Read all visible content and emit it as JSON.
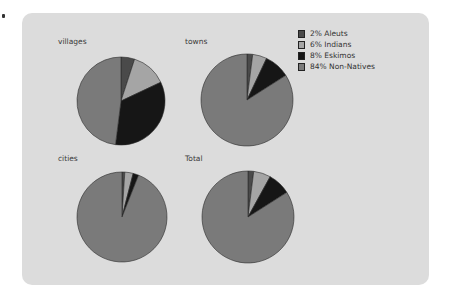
{
  "colors": {
    "panel_bg": "#dcdcdc",
    "Aleuts": "#4a4a4a",
    "Indians": "#a5a5a5",
    "Eskimos": "#161616",
    "Non-Natives": "#7a7a7a",
    "outline": "#2a2a2a"
  },
  "legend": {
    "items": [
      {
        "label": "2% Aleuts",
        "key": "Aleuts"
      },
      {
        "label": "6% Indians",
        "key": "Indians"
      },
      {
        "label": "8% Eskimos",
        "key": "Eskimos"
      },
      {
        "label": "84% Non-Natives",
        "key": "Non-Natives"
      }
    ]
  },
  "pies": [
    {
      "title": "villages",
      "cx": 121,
      "cy": 101,
      "r": 44,
      "label_x": 58,
      "label_y": 37
    },
    {
      "title": "towns",
      "cx": 247,
      "cy": 100,
      "r": 46,
      "label_x": 185,
      "label_y": 37
    },
    {
      "title": "cities",
      "cx": 122,
      "cy": 217,
      "r": 45,
      "label_x": 58,
      "label_y": 154
    },
    {
      "title": "Total",
      "cx": 248,
      "cy": 217,
      "r": 46,
      "label_x": 185,
      "label_y": 154
    }
  ],
  "chart_data": [
    {
      "type": "pie",
      "title": "villages",
      "categories": [
        "Aleuts",
        "Indians",
        "Eskimos",
        "Non-Natives"
      ],
      "values": [
        5,
        13,
        34,
        48
      ]
    },
    {
      "type": "pie",
      "title": "towns",
      "categories": [
        "Aleuts",
        "Indians",
        "Eskimos",
        "Non-Natives"
      ],
      "values": [
        2,
        5,
        9,
        84
      ]
    },
    {
      "type": "pie",
      "title": "cities",
      "categories": [
        "Aleuts",
        "Indians",
        "Eskimos",
        "Non-Natives"
      ],
      "values": [
        1,
        3,
        2,
        94
      ]
    },
    {
      "type": "pie",
      "title": "Total",
      "categories": [
        "Aleuts",
        "Indians",
        "Eskimos",
        "Non-Natives"
      ],
      "values": [
        2,
        6,
        8,
        84
      ],
      "legend": [
        "2% Aleuts",
        "6% Indians",
        "8% Eskimos",
        "84% Non-Natives"
      ],
      "legend_position": "right"
    }
  ]
}
